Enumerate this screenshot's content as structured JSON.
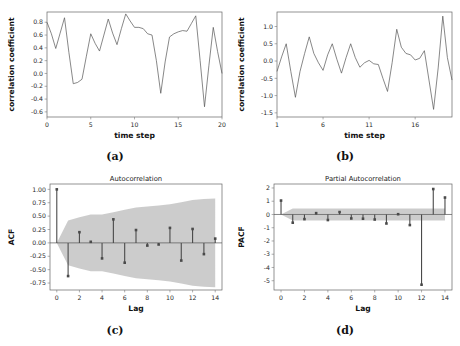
{
  "figure": {
    "panel_count": 4,
    "background": "#ffffff"
  },
  "panels": {
    "a": {
      "caption": "(a)",
      "title": "",
      "xlabel": "time step",
      "ylabel": "correlation coefficient"
    },
    "b": {
      "caption": "(b)",
      "title": "",
      "xlabel": "time step",
      "ylabel": "correlation coefficient"
    },
    "c": {
      "caption": "(c)",
      "title": "Autocorrelation",
      "xlabel": "Lag",
      "ylabel": "ACF"
    },
    "d": {
      "caption": "(d)",
      "title": "Partial Autocorrelation",
      "xlabel": "Lag",
      "ylabel": "PACF"
    }
  },
  "colors": {
    "line": "#555555",
    "stem": "#4a4a4a",
    "ci_band": "#b8b8b8",
    "axis": "#777777",
    "text": "#111111"
  },
  "chart_data": [
    {
      "id": "a",
      "type": "line",
      "title": "",
      "caption": "(a)",
      "xlabel": "time step",
      "ylabel": "correlation coefficient",
      "xlim": [
        0,
        20
      ],
      "ylim": [
        -0.68,
        0.96
      ],
      "xticks": [
        0,
        5,
        10,
        15,
        20
      ],
      "yticks": [
        -0.6,
        -0.4,
        -0.2,
        0.0,
        0.2,
        0.4,
        0.6,
        0.8
      ],
      "ytick_labels": [
        "-0.6",
        "-0.4",
        "-0.2",
        "0.0",
        "0.2",
        "0.4",
        "0.6",
        "0.8"
      ],
      "grid": false,
      "legend": null,
      "x": [
        0,
        0.5,
        1,
        1.5,
        2,
        2.5,
        3,
        3.5,
        4,
        4.5,
        5,
        5.5,
        6,
        6.5,
        7,
        7.5,
        8,
        8.5,
        9,
        9.5,
        10,
        10.5,
        11,
        11.5,
        12,
        12.5,
        13,
        13.5,
        14,
        14.5,
        15,
        15.5,
        16,
        16.5,
        17,
        17.5,
        18,
        18.5,
        19,
        19.5,
        20
      ],
      "values": [
        0.8,
        0.62,
        0.39,
        0.63,
        0.87,
        0.33,
        -0.16,
        -0.14,
        -0.09,
        0.27,
        0.62,
        0.47,
        0.35,
        0.6,
        0.85,
        0.63,
        0.45,
        0.7,
        0.93,
        0.82,
        0.72,
        0.72,
        0.7,
        0.62,
        0.6,
        0.2,
        -0.31,
        0.18,
        0.57,
        0.62,
        0.65,
        0.67,
        0.66,
        0.78,
        0.9,
        0.2,
        -0.52,
        0.12,
        0.72,
        0.34,
        0.0
      ]
    },
    {
      "id": "b",
      "type": "line",
      "title": "",
      "caption": "(b)",
      "xlabel": "time step",
      "ylabel": "correlation coefficient",
      "xlim": [
        1,
        20
      ],
      "ylim": [
        -1.62,
        1.42
      ],
      "xticks": [
        1,
        6,
        11,
        16
      ],
      "yticks": [
        -1.5,
        -1.0,
        -0.5,
        0.0,
        0.5,
        1.0
      ],
      "ytick_labels": [
        "-1.5",
        "-1.0",
        "-0.5",
        "0.0",
        "0.5",
        "1.0"
      ],
      "grid": false,
      "legend": null,
      "x": [
        1,
        1.5,
        2,
        2.5,
        3,
        3.5,
        4,
        4.5,
        5,
        5.5,
        6,
        6.5,
        7,
        7.5,
        8,
        8.5,
        9,
        9.5,
        10,
        10.5,
        11,
        11.5,
        12,
        12.5,
        13,
        13.5,
        14,
        14.5,
        15,
        15.5,
        16,
        16.5,
        17,
        17.5,
        18,
        18.5,
        19,
        19.5,
        20
      ],
      "values": [
        -0.3,
        0.12,
        0.5,
        -0.3,
        -1.05,
        -0.3,
        0.22,
        0.7,
        0.22,
        -0.05,
        -0.27,
        0.18,
        0.5,
        0.05,
        -0.35,
        0.1,
        0.5,
        0.1,
        -0.18,
        -0.05,
        0.02,
        -0.08,
        -0.1,
        -0.5,
        -0.88,
        -0.05,
        0.92,
        0.4,
        0.22,
        0.18,
        0.03,
        0.08,
        0.3,
        -0.55,
        -1.4,
        -0.2,
        1.3,
        0.1,
        -0.55
      ]
    },
    {
      "id": "c",
      "type": "stem",
      "title": "Autocorrelation",
      "caption": "(c)",
      "xlabel": "Lag",
      "ylabel": "ACF",
      "xlim": [
        -0.6,
        14.6
      ],
      "ylim": [
        -0.88,
        1.1
      ],
      "xticks": [
        0,
        2,
        4,
        6,
        8,
        10,
        12,
        14
      ],
      "yticks": [
        -0.75,
        -0.5,
        -0.25,
        0.0,
        0.25,
        0.5,
        0.75,
        1.0
      ],
      "ytick_labels": [
        "-0.75",
        "-0.50",
        "-0.25",
        "0.00",
        "0.25",
        "0.50",
        "0.75",
        "1.00"
      ],
      "grid": false,
      "legend": null,
      "lags": [
        0,
        1,
        2,
        3,
        4,
        5,
        6,
        7,
        8,
        9,
        10,
        11,
        12,
        13,
        14
      ],
      "values": [
        1.0,
        -0.62,
        0.2,
        0.02,
        -0.29,
        0.44,
        -0.37,
        0.24,
        -0.05,
        -0.03,
        0.28,
        -0.33,
        0.26,
        -0.21,
        0.08
      ],
      "ci_upper": [
        0.0,
        0.42,
        0.48,
        0.53,
        0.53,
        0.57,
        0.62,
        0.66,
        0.68,
        0.7,
        0.72,
        0.76,
        0.8,
        0.82,
        0.83
      ],
      "ci_lower": [
        0.0,
        -0.42,
        -0.48,
        -0.53,
        -0.53,
        -0.57,
        -0.62,
        -0.66,
        -0.68,
        -0.7,
        -0.72,
        -0.76,
        -0.8,
        -0.82,
        -0.83
      ]
    },
    {
      "id": "d",
      "type": "stem",
      "title": "Partial Autocorrelation",
      "caption": "(d)",
      "xlabel": "Lag",
      "ylabel": "PACF",
      "xlim": [
        -0.6,
        14.6
      ],
      "ylim": [
        -5.7,
        2.3
      ],
      "xticks": [
        0,
        2,
        4,
        6,
        8,
        10,
        12,
        14
      ],
      "yticks": [
        -5,
        -4,
        -3,
        -2,
        -1,
        0,
        1,
        2
      ],
      "ytick_labels": [
        "-5",
        "-4",
        "-3",
        "-2",
        "-1",
        "0",
        "1",
        "2"
      ],
      "grid": false,
      "legend": null,
      "lags": [
        0,
        1,
        2,
        3,
        4,
        5,
        6,
        7,
        8,
        9,
        10,
        11,
        12,
        13,
        14
      ],
      "values": [
        1.05,
        -0.62,
        -0.35,
        0.1,
        -0.42,
        0.18,
        -0.3,
        -0.32,
        -0.38,
        -0.68,
        0.02,
        -0.8,
        -5.3,
        1.92,
        1.28
      ],
      "ci_upper": [
        0.0,
        0.45,
        0.45,
        0.45,
        0.45,
        0.45,
        0.45,
        0.45,
        0.45,
        0.45,
        0.45,
        0.45,
        0.45,
        0.45,
        0.45
      ],
      "ci_lower": [
        0.0,
        -0.45,
        -0.45,
        -0.45,
        -0.45,
        -0.45,
        -0.45,
        -0.45,
        -0.45,
        -0.45,
        -0.45,
        -0.45,
        -0.45,
        -0.45,
        -0.45
      ]
    }
  ]
}
